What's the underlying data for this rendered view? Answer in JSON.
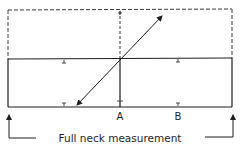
{
  "diagram": {
    "title": "Full neck measurement",
    "labels": {
      "point_a": "A",
      "point_b": "B",
      "measurement": "Full neck measurement"
    },
    "colors": {
      "line": "#1e1e1e",
      "dashed": "#3a3a3a",
      "background": "#ffffff"
    },
    "shapes": {
      "solid_rectangle": {
        "x1": 8,
        "y_top_left": 59,
        "y_top_right": 58,
        "x2": 232,
        "y_bottom": 107
      },
      "dashed_rectangle": {
        "x1": 8,
        "y1": 10,
        "x2": 232,
        "y2": 59
      },
      "center_line_x": 120,
      "diagonal_arrow": {
        "from": [
          76,
          106
        ],
        "to": [
          163,
          15
        ],
        "arrowheads": "both"
      },
      "tick_columns_x": [
        64,
        120,
        178
      ],
      "bracket_left": {
        "x": 9,
        "y_top": 113,
        "y_bottom": 138,
        "x_end": 36
      },
      "bracket_right": {
        "x": 233,
        "y_top": 113,
        "y_bottom": 137,
        "x_start": 205
      }
    }
  }
}
